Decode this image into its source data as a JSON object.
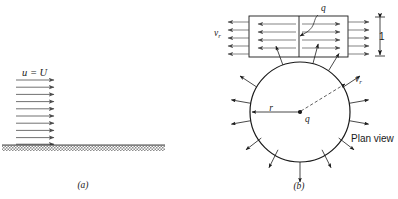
{
  "figure": {
    "panels": [
      {
        "tag": "(a)",
        "tag_x": 83,
        "tag_y": 188,
        "caption_role": "uniform-flow-over-flat-plate",
        "labels": [
          {
            "name": "inlet-velocity-label",
            "text": "u = U",
            "x": 22,
            "y": 76
          }
        ],
        "ground": {
          "x": 2,
          "y": 145,
          "width": 163,
          "height": 6
        },
        "arrows": {
          "count": 10,
          "x_start": 16,
          "x_end": 54,
          "y_first": 80,
          "y_step": 7.2
        }
      },
      {
        "tag": "(b)",
        "tag_x": 299,
        "tag_y": 189,
        "caption_role": "line-source-elevation-and-plan-view",
        "labels": [
          {
            "name": "radial-velocity-label-elevation",
            "text": "v",
            "sub": "r",
            "x": 214,
            "y": 36
          },
          {
            "name": "source-strength-label-elevation",
            "text": "q",
            "x": 321,
            "y": 11
          },
          {
            "name": "unit-height-label",
            "text": "1",
            "x": 379,
            "y": 37
          },
          {
            "name": "radial-velocity-label-plan",
            "text": "v",
            "sub": "r",
            "x": 355,
            "y": 82
          },
          {
            "name": "radius-label",
            "text": "r",
            "x": 271,
            "y": 111
          },
          {
            "name": "source-strength-label-plan",
            "text": "q",
            "x": 308,
            "y": 121
          },
          {
            "name": "plan-view-label",
            "text": "Plan view",
            "x": 351,
            "y": 142
          }
        ],
        "rectangle": {
          "x": 249,
          "y": 16,
          "width": 99,
          "height": 41
        },
        "center_line_x": 299,
        "circle": {
          "cx": 300,
          "cy": 112,
          "r": 50
        },
        "inner_arrow_rows_y": [
          24,
          32,
          40,
          48
        ],
        "outer_arrow_rows_y": [
          22,
          30,
          38,
          46,
          54
        ],
        "radial_arrow_angles_deg": [
          250,
          285,
          305,
          330,
          10,
          35,
          55,
          80,
          110,
          130,
          155,
          180,
          205,
          225
        ]
      }
    ]
  },
  "colors": {
    "stroke": "#1a1a1a",
    "arrow": "#4d4d4d",
    "ground_hatch": "#8c8c8c",
    "background": "#ffffff"
  }
}
